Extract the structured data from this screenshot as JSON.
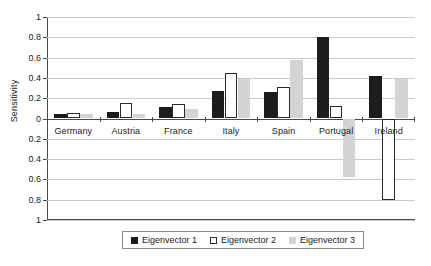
{
  "chart_data": {
    "type": "bar",
    "title": "",
    "xlabel": "",
    "ylabel": "Sensitivity",
    "ylim": [
      -1,
      1
    ],
    "grid": true,
    "legend_position": "bottom",
    "categories": [
      "Germany",
      "Austria",
      "France",
      "Italy",
      "Spain",
      "Portugal",
      "Ireland"
    ],
    "ytick_labels": [
      "1",
      "0.8",
      "0.6",
      "0.4",
      "0.2",
      "0",
      "0.2",
      "0.4",
      "0.6",
      "0.8",
      "1"
    ],
    "ytick_values": [
      1,
      0.8,
      0.6,
      0.4,
      0.2,
      0,
      -0.2,
      -0.4,
      -0.6,
      -0.8,
      -1
    ],
    "series": [
      {
        "name": "Eigenvector 1",
        "color": "#1c1c1c",
        "values": [
          0.04,
          0.06,
          0.11,
          0.27,
          0.26,
          0.8,
          0.42
        ]
      },
      {
        "name": "Eigenvector 2",
        "color": "#ffffff",
        "values": [
          0.05,
          0.15,
          0.14,
          0.45,
          0.31,
          0.12,
          -0.8
        ]
      },
      {
        "name": "Eigenvector 3",
        "color": "#d4d4d4",
        "values": [
          0.04,
          0.04,
          0.09,
          0.39,
          0.58,
          -0.58,
          0.39
        ]
      }
    ]
  }
}
